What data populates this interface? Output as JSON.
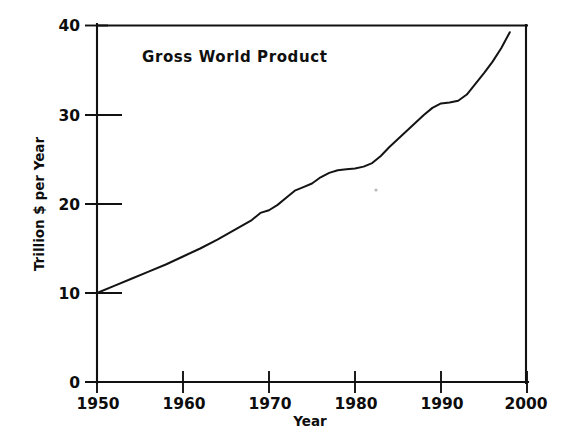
{
  "figure": {
    "background_color": "#ffffff",
    "line_color": "#141414",
    "axis_color": "#111111",
    "text_color": "#0d0d0d"
  },
  "chart_data": {
    "type": "line",
    "title": "Gross World Product",
    "xlabel": "Year",
    "ylabel": "Trillion $ per Year",
    "xlim": [
      1950,
      2000
    ],
    "ylim": [
      0,
      40
    ],
    "xticks": [
      1950,
      1960,
      1970,
      1980,
      1990,
      2000
    ],
    "xtick_labels": [
      "1950",
      "1960",
      "1970",
      "1980",
      "1990",
      "2000"
    ],
    "yticks": [
      0,
      10,
      20,
      30,
      40
    ],
    "ytick_labels": [
      "0",
      "10",
      "20",
      "30",
      "40"
    ],
    "grid": false,
    "legend": null,
    "series": [
      {
        "name": "Gross World Product",
        "x": [
          1950,
          1952,
          1954,
          1956,
          1958,
          1960,
          1962,
          1964,
          1966,
          1968,
          1969,
          1970,
          1971,
          1972,
          1973,
          1974,
          1975,
          1976,
          1977,
          1978,
          1979,
          1980,
          1981,
          1982,
          1983,
          1984,
          1985,
          1986,
          1987,
          1988,
          1989,
          1990,
          1991,
          1992,
          1993,
          1994,
          1995,
          1996,
          1997,
          1998
        ],
        "values": [
          10.0,
          10.8,
          11.6,
          12.4,
          13.2,
          14.1,
          15.0,
          16.0,
          17.1,
          18.2,
          19.0,
          19.3,
          19.9,
          20.7,
          21.5,
          21.9,
          22.3,
          23.0,
          23.5,
          23.8,
          23.9,
          24.0,
          24.2,
          24.6,
          25.4,
          26.4,
          27.3,
          28.2,
          29.1,
          30.0,
          30.8,
          31.3,
          31.4,
          31.6,
          32.3,
          33.5,
          34.7,
          36.0,
          37.5,
          39.3
        ]
      }
    ],
    "annotations": [
      {
        "text": "Gross World Product",
        "x": 1956.5,
        "y": 36.2
      }
    ]
  },
  "geometry": {
    "plot_left_px": 97,
    "plot_right_px": 527,
    "plot_top_px": 26,
    "plot_bottom_px": 382
  }
}
